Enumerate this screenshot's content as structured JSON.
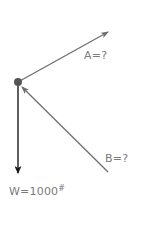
{
  "diagram": {
    "type": "free-body-diagram",
    "colors": {
      "node": "#555555",
      "vector_a": "#6e6e6e",
      "vector_b": "#6e6e6e",
      "vector_w": "#1a1a1a",
      "label": "#7a7a7a"
    },
    "node": {
      "x": 18,
      "y": 82
    },
    "vectors": [
      {
        "id": "A",
        "label": "A=?",
        "from": [
          18,
          82
        ],
        "to": [
          108,
          32
        ],
        "direction": "away-from-node"
      },
      {
        "id": "B",
        "label": "B=?",
        "from": [
          108,
          172
        ],
        "to": [
          21,
          86
        ],
        "direction": "toward-node"
      },
      {
        "id": "W",
        "label_main": "W=1000",
        "label_sup": "#",
        "from": [
          18,
          82
        ],
        "to": [
          18,
          172
        ],
        "direction": "away-from-node"
      }
    ],
    "labels": {
      "a": "A=?",
      "b": "B=?",
      "w_main": "W=1000",
      "w_unit": "#"
    }
  }
}
